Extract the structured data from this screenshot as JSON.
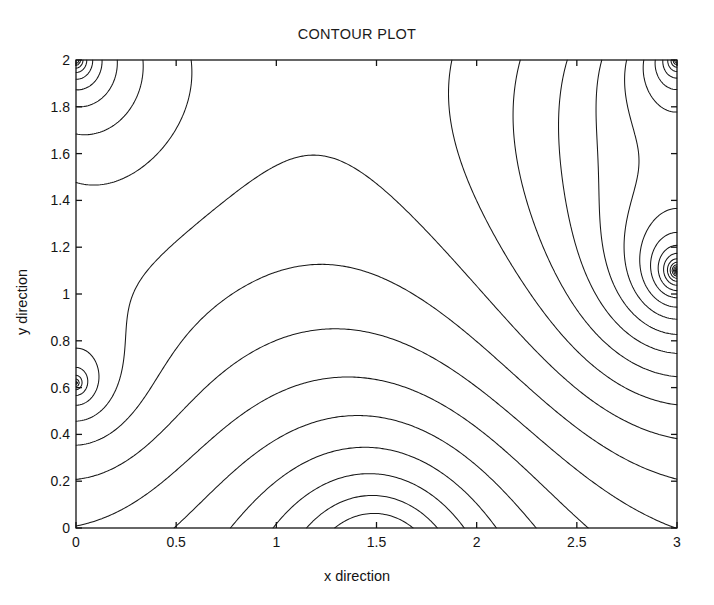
{
  "figure": {
    "title": "CONTOUR PLOT",
    "background_color": "#ffffff",
    "line_color": "#181818",
    "axis_color": "#141414"
  },
  "axes": {
    "x_label": "x direction",
    "y_label": "y direction",
    "x_ticks": [
      "0",
      "0.5",
      "1",
      "1.5",
      "2",
      "2.5",
      "3"
    ],
    "x_tick_values": [
      0,
      0.5,
      1,
      1.5,
      2,
      2.5,
      3
    ],
    "y_ticks": [
      "0",
      "0.2",
      "0.4",
      "0.6",
      "0.8",
      "1",
      "1.2",
      "1.4",
      "1.6",
      "1.8",
      "2"
    ],
    "y_tick_values": [
      0,
      0.2,
      0.4,
      0.6,
      0.8,
      1,
      1.2,
      1.4,
      1.6,
      1.8,
      2
    ],
    "x_range": [
      0,
      3
    ],
    "y_range": [
      0,
      2
    ],
    "tick_direction": "in",
    "box": true,
    "grid": false
  },
  "chart_data": {
    "type": "contour",
    "title": "CONTOUR PLOT",
    "xlabel": "x direction",
    "ylabel": "y direction",
    "xlim": [
      0,
      3
    ],
    "ylim": [
      0,
      2
    ],
    "grid": false,
    "legend": "none",
    "colorbar": false,
    "line_color": "#181818",
    "n_levels": 26,
    "singularities": [
      {
        "name": "top-left-corner",
        "x": 0.0,
        "y": 2.0,
        "type": "sink",
        "strength": -1.0
      },
      {
        "name": "top-right-corner",
        "x": 3.0,
        "y": 2.0,
        "type": "sink",
        "strength": -1.0
      },
      {
        "name": "right-edge-mid",
        "x": 3.0,
        "y": 1.1,
        "type": "sink",
        "strength": -1.25
      },
      {
        "name": "left-edge-lower",
        "x": 0.0,
        "y": 0.62,
        "type": "sink",
        "strength": -0.65
      },
      {
        "name": "bottom-plateau",
        "x": 1.5,
        "y": -0.22,
        "type": "source",
        "strength": 1.45
      }
    ],
    "level_min": -1.0,
    "level_max": 1.0,
    "level_step": 0.08,
    "grid_nx": 301,
    "grid_ny": 201
  }
}
